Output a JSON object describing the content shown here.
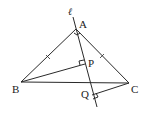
{
  "diagram": {
    "type": "geometry",
    "labels": {
      "line": "ℓ",
      "A": "A",
      "B": "B",
      "C": "C",
      "P": "P",
      "Q": "Q"
    },
    "points": {
      "A": [
        76,
        29
      ],
      "B": [
        21,
        82
      ],
      "C": [
        129,
        83
      ],
      "P": [
        85,
        63
      ],
      "Q": [
        91,
        93
      ]
    },
    "segments": [
      "AB",
      "AC",
      "BC",
      "BP",
      "CQ",
      "line ℓ through A, P, Q"
    ],
    "right_angles": [
      "BP ⟂ ℓ at P",
      "CQ ⟂ ℓ at Q",
      "angle mark at A"
    ],
    "equal_marks": [
      "AB",
      "AC"
    ]
  }
}
